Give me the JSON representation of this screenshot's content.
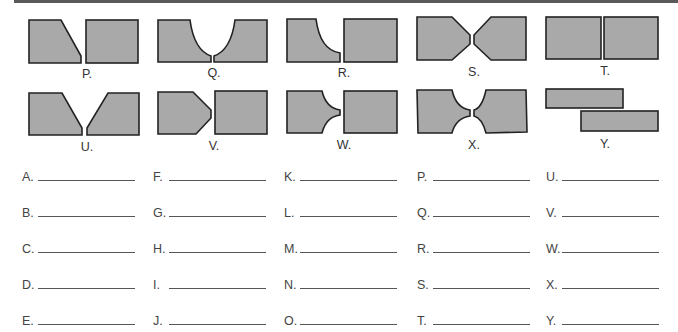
{
  "figures": {
    "P": {
      "label": "P.",
      "description": "Single-bevel butt joint"
    },
    "Q": {
      "label": "Q.",
      "description": "Double-J (U-groove) butt joint"
    },
    "R": {
      "label": "R.",
      "description": "Single-J butt joint"
    },
    "S": {
      "label": "S.",
      "description": "Double-V (X) groove on both plates"
    },
    "T": {
      "label": "T.",
      "description": "Square butt joint"
    },
    "U": {
      "label": "U.",
      "description": "Single-V butt joint"
    },
    "V": {
      "label": "V.",
      "description": "Double-bevel butt joint"
    },
    "W": {
      "label": "W.",
      "description": "Double-J butt joint (one plate)"
    },
    "X": {
      "label": "X.",
      "description": "Double-U butt joint"
    },
    "Y": {
      "label": "Y.",
      "description": "Lap joint"
    }
  },
  "answers": {
    "col1": [
      "A.",
      "B.",
      "C.",
      "D.",
      "E."
    ],
    "col2": [
      "F.",
      "G.",
      "H.",
      "I.",
      "J."
    ],
    "col3": [
      "K.",
      "L.",
      "M.",
      "N.",
      "O."
    ],
    "col4": [
      "P.",
      "Q.",
      "R.",
      "S.",
      "T."
    ],
    "col5": [
      "U.",
      "V.",
      "W.",
      "X.",
      "Y."
    ]
  },
  "colors": {
    "fill": "#a9a9a9",
    "stroke": "#222222",
    "text": "#444444"
  }
}
